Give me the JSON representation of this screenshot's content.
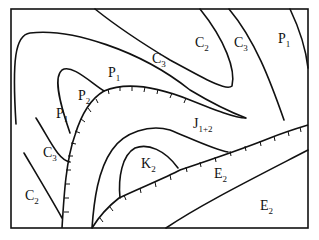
{
  "diagram": {
    "type": "geologic-map",
    "frame": {
      "x": 11,
      "y": 9,
      "width": 297,
      "height": 219
    },
    "labels": [
      {
        "id": "c2-top",
        "base": "C",
        "sub": "2",
        "x": 195,
        "y": 47
      },
      {
        "id": "c3-top",
        "base": "C",
        "sub": "3",
        "x": 234,
        "y": 47
      },
      {
        "id": "p1-top",
        "base": "P",
        "sub": "1",
        "x": 278,
        "y": 43
      },
      {
        "id": "c3-mid",
        "base": "C",
        "sub": "3",
        "x": 152,
        "y": 63
      },
      {
        "id": "p1-mid",
        "base": "P",
        "sub": "1",
        "x": 108,
        "y": 77
      },
      {
        "id": "p2",
        "base": "P",
        "sub": "2",
        "x": 78,
        "y": 100
      },
      {
        "id": "p1-left",
        "base": "P",
        "sub": "1",
        "x": 56,
        "y": 118
      },
      {
        "id": "c3-left",
        "base": "C",
        "sub": "3",
        "x": 43,
        "y": 157
      },
      {
        "id": "c2-left",
        "base": "C",
        "sub": "2",
        "x": 25,
        "y": 200
      },
      {
        "id": "j12",
        "base": "J",
        "sub": "1+2",
        "x": 193,
        "y": 128
      },
      {
        "id": "k2",
        "base": "K",
        "sub": "2",
        "x": 141,
        "y": 168
      },
      {
        "id": "e2-mid",
        "base": "E",
        "sub": "2",
        "x": 214,
        "y": 178
      },
      {
        "id": "e2-low",
        "base": "E",
        "sub": "2",
        "x": 260,
        "y": 210
      }
    ],
    "legend_note": "hachured lines denote faults"
  }
}
